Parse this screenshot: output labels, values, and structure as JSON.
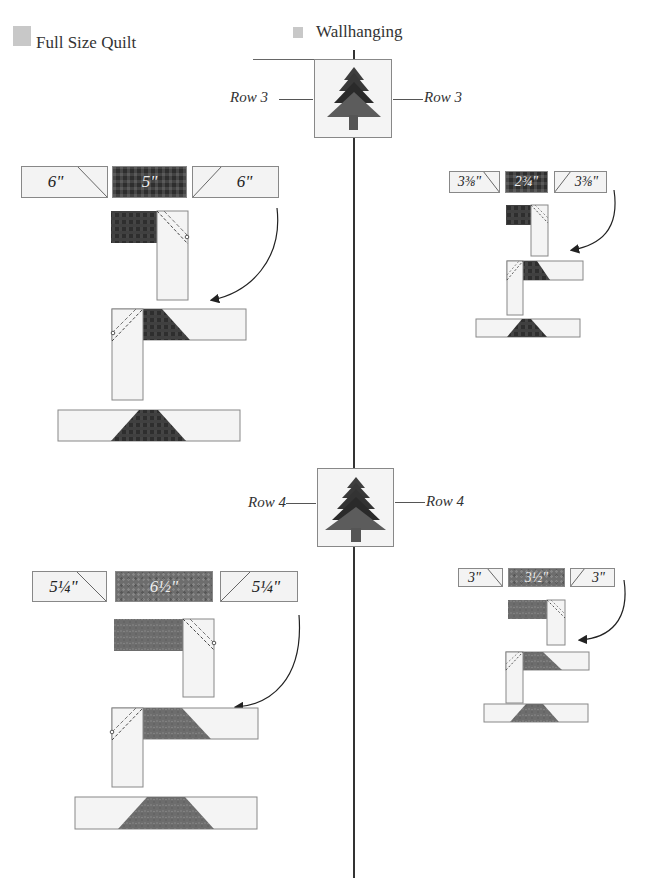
{
  "legend": {
    "full_size": {
      "label": "Full Size Quilt",
      "swatch_color": "#c8c8c8"
    },
    "wallhanging": {
      "label": "Wallhanging",
      "swatch_color": "#c8c8c8"
    }
  },
  "rows": [
    {
      "label_left": "Row 3",
      "label_right": "Row 3",
      "fabric": "dark-check",
      "full_size": {
        "left": "6\"",
        "middle": "5\"",
        "right": "6\""
      },
      "wallhanging": {
        "left": "3⅜\"",
        "middle": "2¾\"",
        "right": "3⅜\""
      }
    },
    {
      "label_left": "Row 4",
      "label_right": "Row 4",
      "fabric": "mid-gray",
      "full_size": {
        "left": "5¼\"",
        "middle": "6½\"",
        "right": "5¼\""
      },
      "wallhanging": {
        "left": "3\"",
        "middle": "3½\"",
        "right": "3\""
      }
    }
  ],
  "colors": {
    "line": "#333333",
    "background_fabric": "#f3f3f3",
    "tree_top": "#3a3a3a",
    "tree_bottom": "#6a6a6a"
  }
}
